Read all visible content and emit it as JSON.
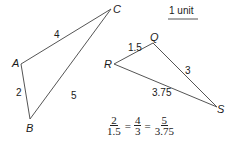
{
  "diagram": {
    "scale_label": "1 unit",
    "triangle_abc": {
      "vertices": {
        "A": "A",
        "B": "B",
        "C": "C"
      },
      "sides": {
        "AC": "4",
        "AB": "2",
        "BC": "5"
      }
    },
    "triangle_qrs": {
      "vertices": {
        "Q": "Q",
        "R": "R",
        "S": "S"
      },
      "sides": {
        "RQ": "1.5",
        "QS": "3",
        "RS": "3.75"
      }
    },
    "equation": {
      "fractions": [
        {
          "num": "2",
          "den": "1.5"
        },
        {
          "num": "4",
          "den": "3"
        },
        {
          "num": "5",
          "den": "3.75"
        }
      ],
      "operator": "="
    },
    "colors": {
      "line": "#555555",
      "text": "#1a1a1a"
    }
  }
}
